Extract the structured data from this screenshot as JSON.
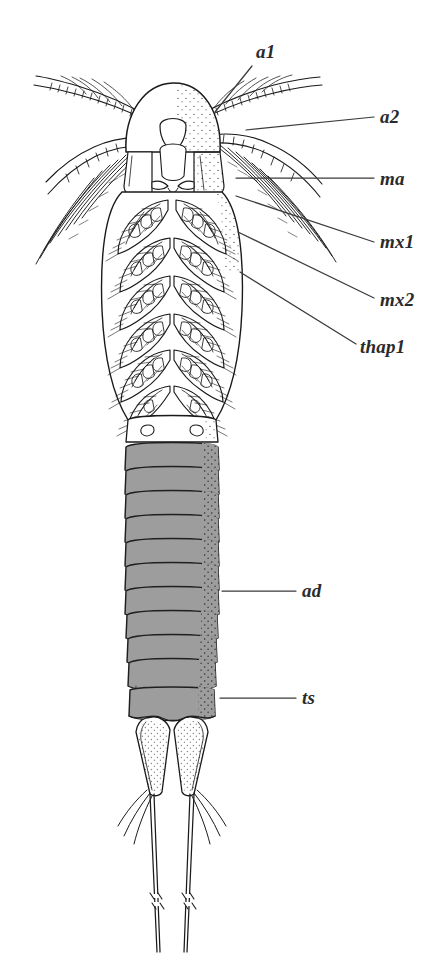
{
  "figure": {
    "kind": "scientific-line-drawing",
    "orientation": "dorsal",
    "background_color": "#ffffff",
    "ink_color": "#1a1a1a",
    "segment_fill_color": "#9d9d9d",
    "segment_stroke_color": "#1f1f1f",
    "label_color": "#2b2b2b",
    "leader_color": "#3a3a3a"
  },
  "labels": [
    {
      "id": "a1",
      "text": "a1",
      "meaning": "antennule (first antenna)",
      "label_x": 256,
      "label_y": 42,
      "leader": {
        "x1": 252,
        "y1": 66,
        "x2": 215,
        "y2": 112,
        "style": "diagonal"
      }
    },
    {
      "id": "a2",
      "text": "a2",
      "meaning": "antenna (second antenna)",
      "label_x": 380,
      "label_y": 107,
      "leader": {
        "x1": 374,
        "y1": 117,
        "x2": 246,
        "y2": 130,
        "style": "horizontal"
      }
    },
    {
      "id": "ma",
      "text": "ma",
      "meaning": "mandible",
      "label_x": 380,
      "label_y": 169,
      "leader": {
        "x1": 374,
        "y1": 178,
        "x2": 236,
        "y2": 178,
        "style": "horizontal"
      }
    },
    {
      "id": "mx1",
      "text": "mx1",
      "meaning": "first maxilla (maxillule)",
      "label_x": 380,
      "label_y": 232,
      "leader": {
        "x1": 374,
        "y1": 242,
        "x2": 236,
        "y2": 196,
        "style": "diagonal"
      }
    },
    {
      "id": "mx2",
      "text": "mx2",
      "meaning": "second maxilla",
      "label_x": 380,
      "label_y": 290,
      "leader": {
        "x1": 374,
        "y1": 298,
        "x2": 238,
        "y2": 232,
        "style": "diagonal"
      }
    },
    {
      "id": "thap1",
      "text": "thap1",
      "meaning": "first thoracopod (thoracic appendage 1)",
      "label_x": 360,
      "label_y": 337,
      "leader": {
        "x1": 356,
        "y1": 344,
        "x2": 240,
        "y2": 272,
        "style": "diagonal"
      }
    },
    {
      "id": "ad",
      "text": "ad",
      "meaning": "abdomen",
      "label_x": 302,
      "label_y": 581,
      "leader": {
        "x1": 296,
        "y1": 591,
        "x2": 222,
        "y2": 591,
        "style": "horizontal"
      }
    },
    {
      "id": "ts",
      "text": "ts",
      "meaning": "telson",
      "label_x": 302,
      "label_y": 688,
      "leader": {
        "x1": 296,
        "y1": 698,
        "x2": 220,
        "y2": 698,
        "style": "horizontal"
      }
    }
  ],
  "anatomy": {
    "head": {
      "name": "cephalon",
      "center_x": 172,
      "top_y": 80,
      "width": 96,
      "height": 72,
      "stipple_side": "right"
    },
    "thorax": {
      "name": "thorax",
      "top_y": 190,
      "bottom_y": 425,
      "left_x": 102,
      "right_x": 243,
      "appendage_pairs": 6,
      "appendage_name": "thoracopods"
    },
    "abdomen": {
      "name": "abdomen",
      "top_y": 443,
      "bottom_y": 690,
      "left_x": 124,
      "right_x": 219,
      "segment_count": 10,
      "fill": "#9d9d9d"
    },
    "telson": {
      "name": "telson",
      "top_y": 690,
      "bottom_y": 722,
      "left_x": 127,
      "right_x": 217
    },
    "caudal_rami": {
      "name": "caudal rami (furca)",
      "top_y": 722,
      "bottom_y": 800,
      "count": 2
    },
    "caudal_setae": {
      "name": "caudal setae",
      "count": 4,
      "break_mark_y": 900,
      "end_y": 952
    },
    "antennules": {
      "name": "antennules",
      "count": 2,
      "span_left_x": 30,
      "span_right_x": 330
    },
    "antennae": {
      "name": "antennae with plumose setae",
      "count": 2
    }
  }
}
